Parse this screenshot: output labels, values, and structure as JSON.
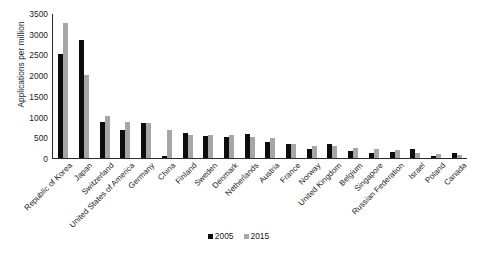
{
  "chart_data": {
    "type": "bar",
    "title": "",
    "xlabel": "",
    "ylabel": "Applications per million",
    "ylim": [
      0,
      3500
    ],
    "yticks": [
      0,
      500,
      1000,
      1500,
      2000,
      2500,
      3000,
      3500
    ],
    "grid": false,
    "legend_position": "bottom-center",
    "categories": [
      "Republic of Korea",
      "Japan",
      "Switzerland",
      "United States of America",
      "Germany",
      "China",
      "Finland",
      "Sweden",
      "Denmark",
      "Netherlands",
      "Austria",
      "France",
      "Norway",
      "United Kingdom",
      "Belgium",
      "Singapore",
      "Russian Federation",
      "Israel",
      "Poland",
      "Canada"
    ],
    "series": [
      {
        "name": "2005",
        "color": "#0d0d0d",
        "values": [
          2520,
          2860,
          870,
          680,
          860,
          60,
          610,
          530,
          500,
          590,
          390,
          340,
          230,
          350,
          180,
          110,
          150,
          210,
          40,
          130
        ]
      },
      {
        "name": "2015",
        "color": "#a6a6a6",
        "values": [
          3290,
          2020,
          1010,
          870,
          850,
          680,
          570,
          560,
          565,
          520,
          480,
          350,
          290,
          280,
          240,
          230,
          185,
          120,
          95,
          85
        ]
      }
    ]
  },
  "legend": {
    "items": [
      {
        "label": "2005",
        "color": "#0d0d0d"
      },
      {
        "label": "2015",
        "color": "#a6a6a6"
      }
    ]
  }
}
